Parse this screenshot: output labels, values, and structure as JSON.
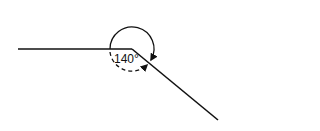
{
  "diagram": {
    "angle_label": "140°",
    "vertex": [
      132,
      49
    ],
    "ray_left_end": [
      18,
      49
    ],
    "ray_right_end": [
      218,
      120
    ],
    "line_color": "#111111",
    "arcs": [
      {
        "style": "solid",
        "description": "reflex angle arc over the top with arrowhead"
      },
      {
        "style": "dashed",
        "description": "interior angle arc below with arrowhead"
      }
    ]
  }
}
